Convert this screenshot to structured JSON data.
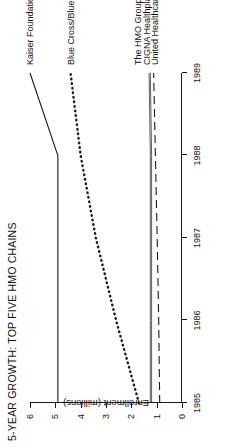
{
  "chart_data": {
    "type": "line",
    "title": "5-YEAR GROWTH: TOP FIVE HMO CHAINS",
    "xlabel": "",
    "ylabel": "Enrollment (millions)",
    "x": [
      1985,
      1986,
      1987,
      1988,
      1989
    ],
    "xtick_labels": [
      "1985",
      "1986",
      "1987",
      "1988",
      "1989"
    ],
    "ytick_labels": [
      "0",
      "1",
      "2",
      "3",
      "4",
      "5",
      "6"
    ],
    "ytick_values": [
      0,
      1,
      2,
      3,
      4,
      5,
      6
    ],
    "xlim": [
      1985,
      1989
    ],
    "ylim": [
      0,
      6
    ],
    "grid": false,
    "legend_position": "right-inline-labels",
    "orientation": "rotated-90-counterclockwise",
    "series": [
      {
        "name": "Kaiser Foundation Health Plan",
        "style": "solid",
        "values": [
          4.9,
          4.9,
          4.9,
          4.9,
          6.0
        ],
        "label_y": 6.0
      },
      {
        "name": "Blue Cross/Blue Shield",
        "style": "dotted",
        "values": [
          1.7,
          2.6,
          3.4,
          4.0,
          4.4
        ],
        "label_y": 4.4
      },
      {
        "name": "The HMO Group",
        "style": "solid-thin",
        "values": [
          1.25,
          1.25,
          1.25,
          1.25,
          1.3
        ],
        "label_y": 1.75
      },
      {
        "name": "CIGNA Healthplan",
        "style": "solid-thin",
        "values": [
          1.2,
          1.2,
          1.2,
          1.2,
          1.25
        ],
        "label_y": 1.4
      },
      {
        "name": "United Healthcare Corp.",
        "style": "long-dash",
        "values": [
          0.88,
          0.92,
          0.98,
          1.05,
          1.12
        ],
        "label_y": 1.05
      }
    ]
  },
  "colors": {
    "ink": "#1a1a1a",
    "background": "#ffffff"
  }
}
